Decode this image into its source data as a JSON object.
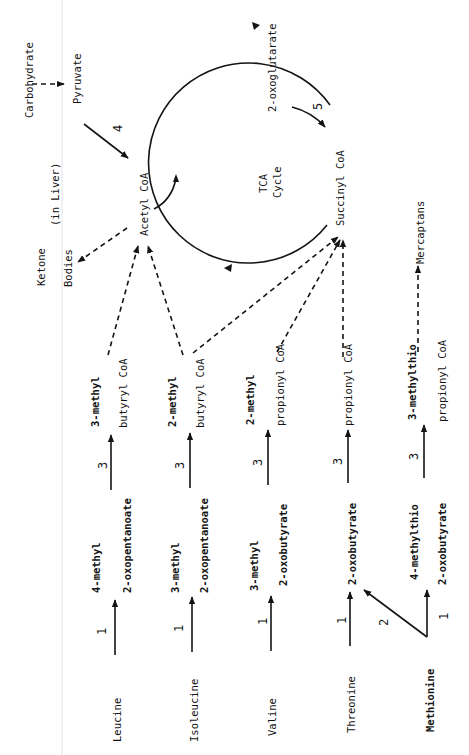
{
  "diagram": {
    "orientation": "rotated-90-ccw",
    "top_region": {
      "carbohydrate": "Carbohydrate",
      "pyruvate": "Pyruvate",
      "acetyl_coa": "Acetyl CoA",
      "ketone": "Ketone",
      "bodies": "Bodies",
      "in_liver": "(in Liver)",
      "tca_line1": "TCA",
      "tca_line2": "Cycle",
      "oxoglutarate": "2-oxoglutarate",
      "succinyl_coa": "Succinyl CoA",
      "mercaptans": "Mercaptans"
    },
    "enzyme_steps": {
      "step1": "1",
      "step2": "2",
      "step3": "3",
      "step4": "4",
      "step5": "5"
    },
    "pathways": [
      {
        "amino_acid": "Leucine",
        "keto_acid_line1": "4-methyl",
        "keto_acid_line2": "2-oxopentanoate",
        "coa_line1": "3-methyl",
        "coa_line2": "butyryl CoA",
        "destination": "Acetyl CoA"
      },
      {
        "amino_acid": "Isoleucine",
        "keto_acid_line1": "3-methyl",
        "keto_acid_line2": "2-oxopentanoate",
        "coa_line1": "2-methyl",
        "coa_line2": "butyryl CoA",
        "destination": "Acetyl CoA / Succinyl CoA"
      },
      {
        "amino_acid": "Valine",
        "keto_acid_line1": "3-methyl",
        "keto_acid_line2": "2-oxobutyrate",
        "coa_line1": "2-methyl",
        "coa_line2": "propionyl CoA",
        "destination": "Succinyl CoA"
      },
      {
        "amino_acid": "Threonine",
        "keto_acid_line1": "",
        "keto_acid_line2": "2-oxobutyrate",
        "coa_line1": "",
        "coa_line2": "propionyl CoA",
        "destination": "Succinyl CoA"
      },
      {
        "amino_acid": "Methionine",
        "keto_acid_line1": "4-methylthio",
        "keto_acid_line2": "2-oxobutyrate",
        "coa_line1": "3-methylthio",
        "coa_line2": "propionyl CoA",
        "destination": "Mercaptans"
      }
    ]
  }
}
